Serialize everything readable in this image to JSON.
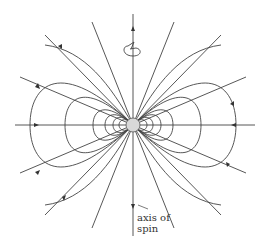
{
  "diagram": {
    "label_line1": "axis of",
    "label_line2": "spin",
    "colors": {
      "line": "#444444",
      "body": "#d8d8d8",
      "background": "#ffffff"
    }
  }
}
